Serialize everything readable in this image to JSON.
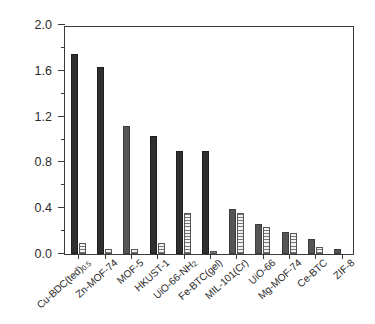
{
  "chart_data": {
    "type": "bar",
    "title": "",
    "xlabel": "",
    "ylabel": "uptake, mmol/g",
    "ylim": [
      0.0,
      2.0
    ],
    "ytick_labels": [
      "0.0",
      "0.4",
      "0.8",
      "1.2",
      "1.6",
      "2.0"
    ],
    "ytick_values": [
      0.0,
      0.4,
      0.8,
      1.2,
      1.6,
      2.0
    ],
    "yminor_values": [
      0.2,
      0.6,
      1.0,
      1.4,
      1.8
    ],
    "grid": false,
    "legend": "none",
    "categories": [
      "Cu-BDC(ted)0.5",
      "Zn-MOF-74",
      "MOF-5",
      "HKUST-1",
      "UiO-66-NH2",
      "Fe-BTC(gel)",
      "MIL-101(Cr)",
      "UiO-66",
      "Mg-MOF-74",
      "Ce-BTC",
      "ZIF-8"
    ],
    "category_labels_html": [
      "Cu-BDC(ted)<sub>0.5</sub>",
      "Zn-MOF-74",
      "MOF-5",
      "HKUST-1",
      "UiO-66-NH<sub>2</sub>",
      "Fe-BTC(gel)",
      "MIL-101(Cr)",
      "UiO-66",
      "Mg-MOF-74",
      "Ce-BTC",
      "ZIF-8"
    ],
    "series": [
      {
        "name": "solid",
        "style": "filled",
        "values": [
          1.75,
          1.63,
          1.12,
          1.03,
          0.9,
          0.9,
          0.39,
          0.26,
          0.19,
          0.13,
          0.04
        ]
      },
      {
        "name": "hatched",
        "style": "hatched",
        "values": [
          0.1,
          0.04,
          0.04,
          0.1,
          0.36,
          0.03,
          0.36,
          0.24,
          0.18,
          0.06,
          0.0
        ]
      }
    ],
    "series_shading": [
      "dark",
      "dark",
      "mid",
      "dark",
      "dark",
      "dark",
      "mid",
      "mid",
      "mid",
      "mid",
      "mid"
    ]
  }
}
